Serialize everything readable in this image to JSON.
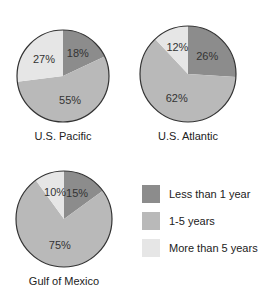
{
  "chart_data": {
    "type": "pie",
    "legend": [
      {
        "label": "Less than 1 year",
        "color": "#8c8c8c"
      },
      {
        "label": "1-5 years",
        "color": "#b9b9b9"
      },
      {
        "label": "More than 5 years",
        "color": "#e6e6e6"
      }
    ],
    "pies": [
      {
        "title": "U.S. Pacific",
        "values": [
          18,
          55,
          27
        ],
        "labels": [
          "18%",
          "55%",
          "27%"
        ]
      },
      {
        "title": "U.S. Atlantic",
        "values": [
          26,
          62,
          12
        ],
        "labels": [
          "26%",
          "62%",
          "12%"
        ]
      },
      {
        "title": "Gulf of Mexico",
        "values": [
          15,
          75,
          10
        ],
        "labels": [
          "15%",
          "75%",
          "10%"
        ]
      }
    ]
  }
}
